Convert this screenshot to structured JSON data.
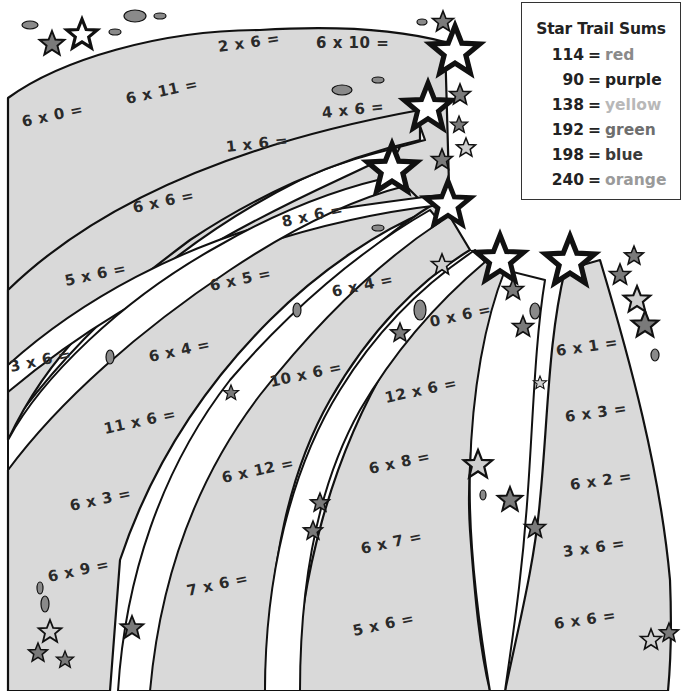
{
  "legend": {
    "title": "Star Trail Sums",
    "entries": [
      {
        "sum": "114",
        "color_name": "red",
        "text_color": "#8a8a8a"
      },
      {
        "sum": "90",
        "color_name": "purple",
        "text_color": "#222222"
      },
      {
        "sum": "138",
        "color_name": "yellow",
        "text_color": "#b8b8b8"
      },
      {
        "sum": "192",
        "color_name": "green",
        "text_color": "#6e6e6e"
      },
      {
        "sum": "198",
        "color_name": "blue",
        "text_color": "#3a3a3a"
      },
      {
        "sum": "240",
        "color_name": "orange",
        "text_color": "#9a9a9a"
      }
    ]
  },
  "trails": [
    {
      "name": "trail-1",
      "problems": [
        "2 x 6 =",
        "6 x 10 =",
        "6 x 0 =",
        "6 x 11 ="
      ]
    },
    {
      "name": "trail-2",
      "problems": [
        "4 x 6 =",
        "1 x 6 =",
        "6 x 6 =",
        "5 x 6 =",
        "3 x 6 ="
      ]
    },
    {
      "name": "trail-3",
      "problems": [
        "8 x 6 =",
        "6 x 5 =",
        "6 x 4 =",
        "11 x 6 =",
        "6 x 3 =",
        "6 x 9 ="
      ]
    },
    {
      "name": "trail-4",
      "problems": [
        "6 x 4 =",
        "10 x 6 =",
        "6 x 12 =",
        "7 x 6 ="
      ]
    },
    {
      "name": "trail-5",
      "problems": [
        "0 x 6 =",
        "12 x 6 =",
        "6 x 8 =",
        "6 x 7 =",
        "5 x 6 ="
      ]
    },
    {
      "name": "trail-6",
      "problems": [
        "6 x 1 =",
        "6 x 3 =",
        "6 x 2 =",
        "3 x 6 =",
        "6 x 6 ="
      ]
    }
  ],
  "colors": {
    "band_fill": "#d9d9d9",
    "band_stroke": "#111111",
    "star_dark": "#7a7a7a",
    "star_light": "#cfcfcf",
    "star_white": "#ffffff"
  }
}
